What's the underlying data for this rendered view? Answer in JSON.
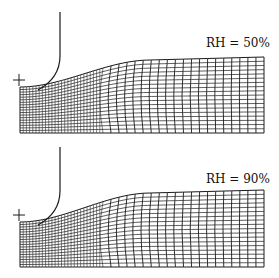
{
  "panels": [
    {
      "label": "RH = 50%",
      "relative_humidity_percent": 50
    },
    {
      "label": "RH = 90%",
      "relative_humidity_percent": 90
    }
  ],
  "mesh": {
    "dense_columns": 26,
    "coarse_columns": 20,
    "rows": 18
  },
  "colors": {
    "line": "#1a1a1a",
    "background": "#ffffff"
  }
}
